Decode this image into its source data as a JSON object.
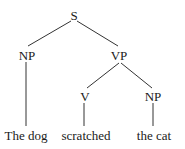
{
  "tree": {
    "nodes": {
      "s": "S",
      "np_subject": "NP",
      "vp": "VP",
      "v": "V",
      "np_object": "NP"
    },
    "leaves": {
      "subject": "The dog",
      "verb": "scratched",
      "object": "the cat"
    },
    "structure": "[S [NP The dog] [VP [V scratched] [NP the cat]]]"
  }
}
